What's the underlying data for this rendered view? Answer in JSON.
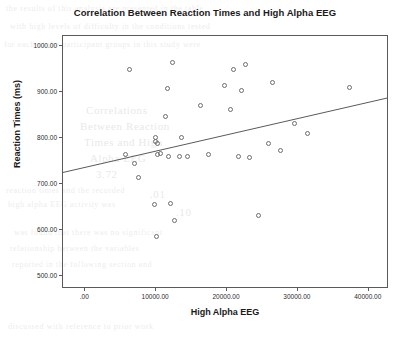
{
  "chart_data": {
    "type": "scatter",
    "title": "Correlation Between Reaction Times and High Alpha EEG",
    "xlabel": "High Alpha EEG",
    "ylabel": "Reaction Times (ms)",
    "xlim": [
      -3000,
      43000
    ],
    "ylim": [
      470,
      1020
    ],
    "grid": false,
    "legend": null,
    "xticks": [
      0,
      10000,
      20000,
      30000,
      40000
    ],
    "xtick_labels": [
      ".00",
      "10000.00",
      "20000.00",
      "30000.00",
      "40000.00"
    ],
    "yticks": [
      500,
      600,
      700,
      800,
      900,
      1000
    ],
    "ytick_labels": [
      "500.00",
      "600.00",
      "700.00",
      "800.00",
      "900.00",
      "1000.00"
    ],
    "marker": "open-circle",
    "marker_color": "#6d6d6d",
    "series": [
      {
        "name": "Participants",
        "points": [
          {
            "x": 6400,
            "y": 948
          },
          {
            "x": 5800,
            "y": 762
          },
          {
            "x": 7100,
            "y": 742
          },
          {
            "x": 7700,
            "y": 712
          },
          {
            "x": 10000,
            "y": 800
          },
          {
            "x": 10100,
            "y": 790
          },
          {
            "x": 10400,
            "y": 787
          },
          {
            "x": 10300,
            "y": 763
          },
          {
            "x": 10700,
            "y": 765
          },
          {
            "x": 9900,
            "y": 654
          },
          {
            "x": 10200,
            "y": 585
          },
          {
            "x": 11400,
            "y": 845
          },
          {
            "x": 11700,
            "y": 905
          },
          {
            "x": 12400,
            "y": 962
          },
          {
            "x": 11900,
            "y": 758
          },
          {
            "x": 12200,
            "y": 655
          },
          {
            "x": 12700,
            "y": 620
          },
          {
            "x": 13700,
            "y": 800
          },
          {
            "x": 13500,
            "y": 757
          },
          {
            "x": 14600,
            "y": 757
          },
          {
            "x": 16400,
            "y": 868
          },
          {
            "x": 17600,
            "y": 762
          },
          {
            "x": 19800,
            "y": 913
          },
          {
            "x": 20700,
            "y": 860
          },
          {
            "x": 21100,
            "y": 947
          },
          {
            "x": 22200,
            "y": 902
          },
          {
            "x": 22800,
            "y": 957
          },
          {
            "x": 21700,
            "y": 757
          },
          {
            "x": 23300,
            "y": 756
          },
          {
            "x": 24600,
            "y": 629
          },
          {
            "x": 26000,
            "y": 787
          },
          {
            "x": 26600,
            "y": 919
          },
          {
            "x": 27700,
            "y": 772
          },
          {
            "x": 29700,
            "y": 829
          },
          {
            "x": 31500,
            "y": 807
          },
          {
            "x": 37400,
            "y": 907
          }
        ]
      }
    ],
    "fit_line": {
      "name": "linear-fit",
      "color": "#5a5a5a",
      "x_start": -3000,
      "y_start": 721,
      "x_end": 43000,
      "y_end": 884
    }
  },
  "background_text": {
    "lines": [
      "the results of this analysis are presented in the table",
      "with high levels of difficulty in the conditions tested",
      "for each of the participant groups in this study were",
      "Correlations",
      "Between Reaction",
      "Times and High",
      "Alpha EEG",
      "reaction times and the recorded",
      "high alpha EEG activity was",
      "3.72",
      ".01",
      ".10",
      "was found that there was no significant",
      "relationship between the variables",
      "reported in the following section and",
      "discussed with reference to prior work"
    ]
  }
}
